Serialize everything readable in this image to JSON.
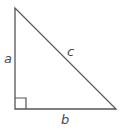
{
  "diagram": {
    "type": "right-triangle",
    "colors": {
      "stroke": "#555555",
      "label": "#4a4a4a",
      "background": "#ffffff"
    },
    "vertices": {
      "top": [
        15,
        8
      ],
      "right_angle": [
        15,
        109
      ],
      "bottom_right": [
        116,
        109
      ]
    },
    "right_angle_marker_size": 11,
    "labels": {
      "a": "a",
      "b": "b",
      "c": "c"
    }
  }
}
